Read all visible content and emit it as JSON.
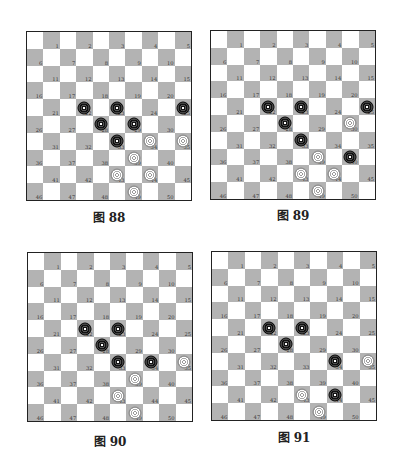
{
  "colors": {
    "dark_square": "#b3b3b3",
    "light_square": "#ffffff",
    "black_piece": "#111111",
    "white_piece": "#ffffff"
  },
  "diagrams": [
    {
      "caption": "图 88",
      "board": {
        "size": 10,
        "numbering": "1-50 on dark squares"
      },
      "black": [
        22,
        23,
        25,
        28,
        29,
        33
      ],
      "white": [
        34,
        35,
        39,
        43,
        44,
        49
      ]
    },
    {
      "caption": "图 89",
      "board": {
        "size": 10,
        "numbering": "1-50 on dark squares"
      },
      "black": [
        22,
        23,
        25,
        28,
        33,
        40
      ],
      "white": [
        30,
        39,
        43,
        44,
        49
      ]
    },
    {
      "caption": "图 90",
      "board": {
        "size": 10,
        "numbering": "1-50 on dark squares"
      },
      "black": [
        22,
        23,
        28,
        33,
        34
      ],
      "white": [
        35,
        39,
        43,
        49
      ]
    },
    {
      "caption": "图 91",
      "board": {
        "size": 10,
        "numbering": "1-50 on dark squares"
      },
      "black": [
        22,
        23,
        28,
        34,
        44
      ],
      "white": [
        35,
        43,
        49
      ]
    }
  ]
}
